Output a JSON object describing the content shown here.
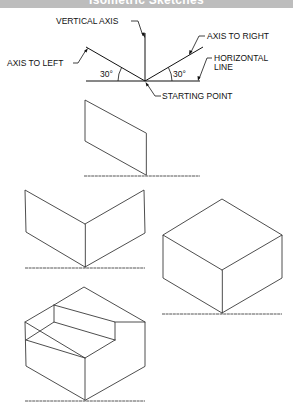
{
  "header": {
    "title": "Isometric Sketches",
    "background_color": "#bdbdbd"
  },
  "axes_diagram": {
    "labels": {
      "vertical_axis": "VERTICAL AXIS",
      "axis_to_right": "AXIS TO RIGHT",
      "axis_to_left": "AXIS TO LEFT",
      "horizontal_line_1": "HORIZONTAL",
      "horizontal_line_2": "LINE",
      "starting_point": "STARTING POINT",
      "angle_left": "30°",
      "angle_right": "30°"
    }
  },
  "steps": [
    {
      "name": "step-1-single-face"
    },
    {
      "name": "step-2-two-faces"
    },
    {
      "name": "step-3-complete-box"
    },
    {
      "name": "step-4-stepped-block"
    }
  ]
}
